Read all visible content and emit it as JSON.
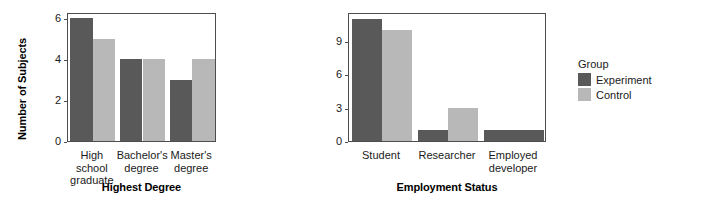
{
  "legend": {
    "title": "Group",
    "entries": [
      {
        "label": "Experiment",
        "color": "#595959"
      },
      {
        "label": "Control",
        "color": "#b8b8b8"
      }
    ]
  },
  "chart_data": [
    {
      "type": "bar",
      "title": "",
      "xlabel": "Highest Degree",
      "ylabel": "Number of Subjects",
      "categories": [
        "High school graduate",
        "Bachelor's degree",
        "Master's degree"
      ],
      "category_lines": [
        [
          "High school",
          "graduate"
        ],
        [
          "Bachelor's",
          "degree"
        ],
        [
          "Master's",
          "degree"
        ]
      ],
      "series": [
        {
          "name": "Experiment",
          "color": "#595959",
          "values": [
            6,
            4,
            3
          ]
        },
        {
          "name": "Control",
          "color": "#b8b8b8",
          "values": [
            5,
            4,
            4
          ]
        }
      ],
      "ylim": [
        0,
        6.3
      ],
      "yticks": [
        0,
        2,
        4,
        6
      ],
      "ytick_labels": [
        "0",
        "2",
        "4",
        "6"
      ],
      "grid": false,
      "legend_position": "right"
    },
    {
      "type": "bar",
      "title": "",
      "xlabel": "Employment Status",
      "ylabel": "",
      "categories": [
        "Student",
        "Researcher",
        "Employed developer"
      ],
      "category_lines": [
        [
          "Student"
        ],
        [
          "Researcher"
        ],
        [
          "Employed",
          "developer"
        ]
      ],
      "series": [
        {
          "name": "Experiment",
          "color": "#595959",
          "values": [
            11,
            1,
            1
          ]
        },
        {
          "name": "Control",
          "color": "#b8b8b8",
          "values": [
            10,
            3,
            null
          ]
        }
      ],
      "ylim": [
        0,
        11.6
      ],
      "yticks": [
        0,
        3,
        6,
        9
      ],
      "ytick_labels": [
        "0",
        "3",
        "6",
        "9"
      ],
      "grid": false,
      "legend_position": "right"
    }
  ]
}
